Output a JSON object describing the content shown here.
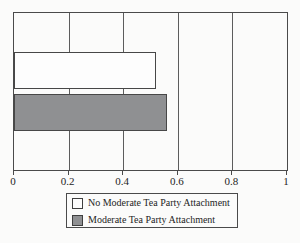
{
  "chart_data": {
    "type": "bar",
    "orientation": "horizontal",
    "title": "",
    "xlabel": "",
    "ylabel": "",
    "categories": [
      "No Moderate Tea Party Attachment",
      "Moderate Tea Party Attachment"
    ],
    "values": [
      0.52,
      0.56
    ],
    "bar_colors": [
      "#fdfdfd",
      "#8f9092"
    ],
    "xlim": [
      0,
      1
    ],
    "x_ticks": [
      0,
      0.2,
      0.4,
      0.6,
      0.8,
      1
    ],
    "x_tick_labels": [
      "0",
      "0.2",
      "0.4",
      "0.6",
      "0.8",
      "1"
    ],
    "grid": true,
    "legend": {
      "position": "bottom",
      "entries": [
        {
          "label": "No Moderate Tea Party Attachment",
          "color": "#fdfdfd"
        },
        {
          "label": "Moderate Tea Party Attachment",
          "color": "#8f9092"
        }
      ]
    }
  },
  "styles": {
    "line_color": "#4a4a4a",
    "background": "#fbfbfa"
  }
}
